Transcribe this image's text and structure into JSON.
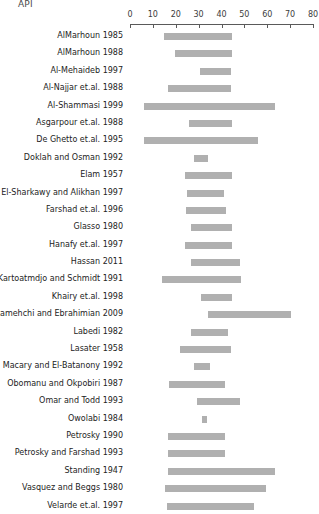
{
  "chart_data": {
    "type": "bar",
    "orientation": "horizontal",
    "bar_style": "range",
    "title": "API",
    "xlabel": "",
    "ylabel": "",
    "xlim": [
      0,
      80
    ],
    "xticks": [
      0,
      10,
      20,
      30,
      40,
      50,
      60,
      70,
      80
    ],
    "xtick_labels": [
      "0",
      "10",
      "20",
      "30",
      "40",
      "50",
      "60",
      "70",
      "80"
    ],
    "grid": false,
    "legend": null,
    "axis_position": "top",
    "bar_color": "#b0b0b0",
    "categories": [
      "AlMarhoun 1985",
      "AlMarhoun 1988",
      "Al-Mehaideb 1997",
      "Al-Najjar et.al. 1988",
      "Al-Shammasi 1999",
      "Asgarpour et.al. 1988",
      "De Ghetto et.al. 1995",
      "Doklah and Osman 1992",
      "Elam 1957",
      "El-Sharkawy and Alikhan 1997",
      "Farshad et.al. 1996",
      "Glasso 1980",
      "Hanafy et.al. 1997",
      "Hassan 2011",
      "Kartoatmdjo and Schmidt 1991",
      "Khairy et.al. 1998",
      "Khamehchi and Ebrahimian 2009",
      "Labedi 1982",
      "Lasater 1958",
      "Macary and El-Batanony 1992",
      "Obomanu and Okpobiri 1987",
      "Omar and Todd 1993",
      "Owolabi 1984",
      "Petrosky 1990",
      "Petrosky and Farshad 1993",
      "Standing 1947",
      "Vasquez and Beggs 1980",
      "Velarde et.al. 1997"
    ],
    "ranges": [
      {
        "label": "AlMarhoun 1985",
        "start": 15.0,
        "end": 44.5
      },
      {
        "label": "AlMarhoun 1988",
        "start": 19.5,
        "end": 44.5
      },
      {
        "label": "Al-Mehaideb 1997",
        "start": 30.5,
        "end": 44.0
      },
      {
        "label": "Al-Najjar et.al. 1988",
        "start": 16.5,
        "end": 44.0
      },
      {
        "label": "Al-Shammasi 1999",
        "start": 6.0,
        "end": 63.5
      },
      {
        "label": "Asgarpour et.al. 1988",
        "start": 26.0,
        "end": 44.5
      },
      {
        "label": "De Ghetto et.al. 1995",
        "start": 6.0,
        "end": 56.0
      },
      {
        "label": "Doklah and Osman 1992",
        "start": 28.0,
        "end": 34.0
      },
      {
        "label": "Elam 1957",
        "start": 24.0,
        "end": 44.5
      },
      {
        "label": "El-Sharkawy and Alikhan 1997",
        "start": 25.0,
        "end": 41.0
      },
      {
        "label": "Farshad et.al. 1996",
        "start": 24.5,
        "end": 42.0
      },
      {
        "label": "Glasso 1980",
        "start": 26.5,
        "end": 44.5
      },
      {
        "label": "Hanafy et.al. 1997",
        "start": 24.0,
        "end": 44.5
      },
      {
        "label": "Hassan 2011",
        "start": 26.5,
        "end": 48.0
      },
      {
        "label": "Kartoatmdjo and Schmidt 1991",
        "start": 14.0,
        "end": 48.5
      },
      {
        "label": "Khairy et.al. 1998",
        "start": 31.0,
        "end": 44.5
      },
      {
        "label": "Khamehchi and Ebrahimian 2009",
        "start": 34.0,
        "end": 70.5
      },
      {
        "label": "Labedi 1982",
        "start": 26.5,
        "end": 43.0
      },
      {
        "label": "Lasater 1958",
        "start": 22.0,
        "end": 44.0
      },
      {
        "label": "Macary and El-Batanony 1992",
        "start": 28.0,
        "end": 35.0
      },
      {
        "label": "Obomanu and Okpobiri 1987",
        "start": 17.0,
        "end": 41.5
      },
      {
        "label": "Omar and Todd 1993",
        "start": 29.5,
        "end": 48.0
      },
      {
        "label": "Owolabi 1984",
        "start": 31.5,
        "end": 33.5
      },
      {
        "label": "Petrosky 1990",
        "start": 16.5,
        "end": 41.5
      },
      {
        "label": "Petrosky and Farshad 1993",
        "start": 16.5,
        "end": 41.5
      },
      {
        "label": "Standing 1947",
        "start": 16.5,
        "end": 63.5
      },
      {
        "label": "Vasquez and Beggs 1980",
        "start": 15.5,
        "end": 59.5
      },
      {
        "label": "Velarde et.al. 1997",
        "start": 16.0,
        "end": 54.0
      }
    ]
  }
}
